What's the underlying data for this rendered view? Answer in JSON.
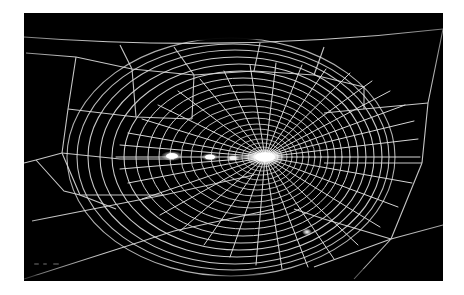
{
  "page": {
    "background_color": "#ffffff",
    "photo": {
      "label": "spider-web-photograph",
      "background_color": "#000000",
      "thread_color": "#e8e8e8",
      "x": 24,
      "y": 13,
      "width": 419,
      "height": 268,
      "subject": "orb spider web",
      "lighting": "dark field, threads lit white against black background",
      "hub": {
        "cx": 241,
        "cy": 144,
        "bright": true
      },
      "highlights": [
        {
          "name": "hub-glow",
          "cx": 241,
          "cy": 144,
          "rx": 16,
          "ry": 6
        },
        {
          "name": "debris-blob-1",
          "cx": 148,
          "cy": 143,
          "rx": 9,
          "ry": 4
        },
        {
          "name": "debris-blob-2",
          "cx": 186,
          "cy": 144,
          "rx": 7,
          "ry": 3
        },
        {
          "name": "debris-blob-3",
          "cx": 209,
          "cy": 145,
          "rx": 5,
          "ry": 3
        },
        {
          "name": "lower-spot",
          "cx": 283,
          "cy": 219,
          "rx": 4,
          "ry": 3
        }
      ],
      "structure": {
        "radial_count": 34,
        "spiral_rings": 26,
        "frame_threads": 9,
        "anchor_points": [
          {
            "name": "left-anchor",
            "x": 13,
            "y": 147
          },
          {
            "name": "lower-right-anchor",
            "x": 367,
            "y": 227
          },
          {
            "name": "top-bridge-left",
            "x": 2,
            "y": 26
          },
          {
            "name": "top-bridge-right",
            "x": 416,
            "y": 18
          }
        ]
      },
      "bottom_marks": [
        "mark-1",
        "mark-2",
        "mark-3"
      ]
    }
  }
}
